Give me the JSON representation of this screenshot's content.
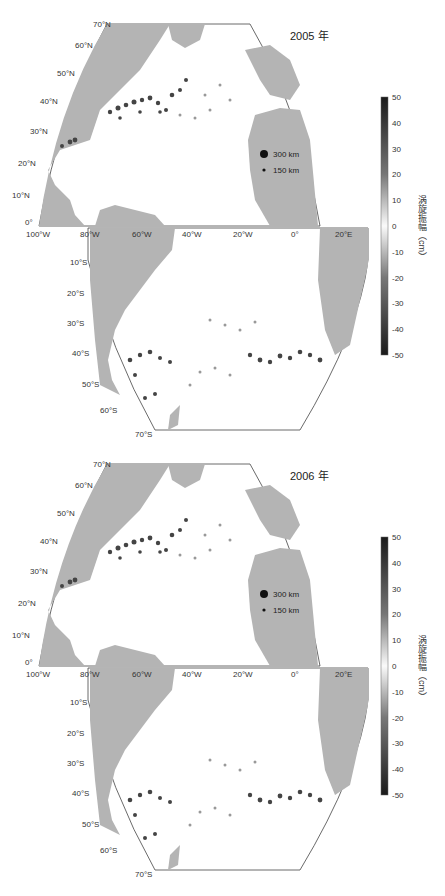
{
  "figure": {
    "panels": [
      {
        "year_label": "2005 年",
        "lat_labels_north": [
          "70°N",
          "60°N",
          "50°N",
          "40°N",
          "30°N",
          "20°N",
          "10°N",
          "0°"
        ],
        "lon_labels": [
          "100°W",
          "80°W",
          "60°W",
          "40°W",
          "20°W",
          "0°",
          "20°E"
        ],
        "lat_labels_south": [
          "10°S",
          "20°S",
          "30°S",
          "40°S",
          "50°S",
          "60°S",
          "70°S"
        ],
        "legend": {
          "large": "300 km",
          "small": "150 km"
        },
        "colorbar": {
          "ticks": [
            "50",
            "40",
            "30",
            "20",
            "10",
            "0",
            "-10",
            "-20",
            "-30",
            "-40",
            "-50"
          ],
          "title": "涡旋振幅（cm）"
        }
      },
      {
        "year_label": "2006 年",
        "lat_labels_north": [
          "70°N",
          "60°N",
          "50°N",
          "40°N",
          "30°N",
          "20°N",
          "10°N",
          "0°"
        ],
        "lon_labels": [
          "100°W",
          "80°W",
          "60°W",
          "40°W",
          "20°W",
          "0°",
          "20°E"
        ],
        "lat_labels_south": [
          "10°S",
          "20°S",
          "30°S",
          "40°S",
          "50°S",
          "60°S",
          "70°S"
        ],
        "legend": {
          "large": "300 km",
          "small": "150 km"
        },
        "colorbar": {
          "ticks": [
            "50",
            "40",
            "30",
            "20",
            "10",
            "0",
            "-10",
            "-20",
            "-30",
            "-40",
            "-50"
          ],
          "title": "涡旋振幅（cm）"
        }
      }
    ],
    "colors": {
      "land": "#b4b4b4",
      "ocean": "#ffffff",
      "eddy_dark": "#2a2a2a",
      "eddy_mid": "#888888",
      "frame": "#444444"
    }
  }
}
